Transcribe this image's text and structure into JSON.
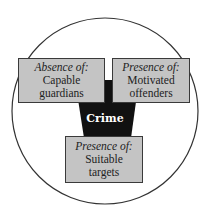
{
  "diagram": {
    "center_label": "Crime",
    "boxes": [
      {
        "heading": "Absence of:",
        "line1": "Capable",
        "line2": "guardians"
      },
      {
        "heading": "Presence of:",
        "line1": "Motivated",
        "line2": "offenders"
      },
      {
        "heading": "Presence of:",
        "line1": "Suitable",
        "line2": "targets"
      }
    ],
    "colors": {
      "box_fill": "#c4c4c4",
      "center_fill": "#111111",
      "circle_stroke": "#333333"
    }
  }
}
